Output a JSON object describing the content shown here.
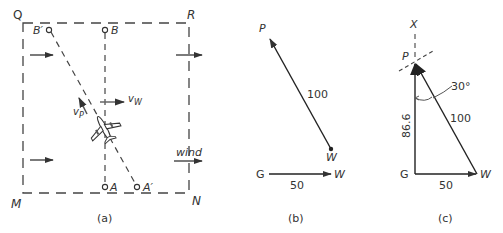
{
  "figure": {
    "panels": [
      {
        "id": "a",
        "caption": "(a)",
        "corners": {
          "top_left": "Q",
          "top_right": "R",
          "bottom_left": "M",
          "bottom_right": "N"
        },
        "points": {
          "B": "B",
          "B_prime": "B′",
          "A": "A",
          "A_prime": "A′"
        },
        "vectors": {
          "plane_velocity": "v",
          "plane_velocity_sub": "P",
          "wind_velocity": "v",
          "wind_velocity_sub": "W"
        },
        "wind_label": "wind"
      },
      {
        "id": "b",
        "caption": "(b)",
        "labels": {
          "P": "P",
          "W_top": "W",
          "G": "G",
          "W_bottom": "W"
        },
        "magnitudes": {
          "plane": "100",
          "wind": "50"
        }
      },
      {
        "id": "c",
        "caption": "(c)",
        "labels": {
          "X": "X",
          "P": "P",
          "G": "G",
          "W": "W"
        },
        "magnitudes": {
          "hypotenuse": "100",
          "vertical": "86.6",
          "base": "50"
        },
        "angle": "30°"
      }
    ]
  },
  "colors": {
    "ink": "#333333",
    "background": "#ffffff"
  }
}
